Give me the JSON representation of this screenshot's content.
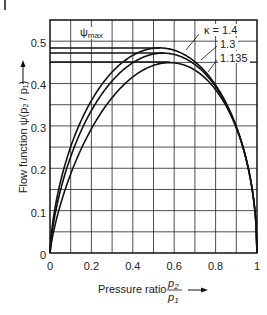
{
  "chart_data": {
    "type": "line",
    "title": "",
    "xlabel": "Pressure ratio p2/p1",
    "ylabel": "Flow function ψ(p2 / p1)",
    "xlim": [
      0,
      1
    ],
    "ylim": [
      0,
      0.55
    ],
    "grid": true,
    "x_ticks": [
      "0",
      "0.2",
      "0.4",
      "0.6",
      "0.8",
      "1"
    ],
    "y_ticks": [
      "0",
      "0.1",
      "0.2",
      "0.3",
      "0.4",
      "0.5"
    ],
    "annotations": [
      "ψmax",
      "κ = 1.4",
      "1.3",
      "1.135"
    ],
    "series": [
      {
        "name": "κ = 1.4",
        "kappa": 1.4,
        "psi_max": 0.484,
        "x_at_max": 0.528
      },
      {
        "name": "1.3",
        "kappa": 1.3,
        "psi_max": 0.472,
        "x_at_max": 0.546
      },
      {
        "name": "1.135",
        "kappa": 1.135,
        "psi_max": 0.451,
        "x_at_max": 0.577
      }
    ]
  },
  "labels": {
    "xlabel_text": "Pressure ratio",
    "xlabel_num": "p",
    "xlabel_num_sub": "2",
    "xlabel_den": "p",
    "xlabel_den_sub": "1",
    "ylabel": "Flow function ψ(p₂ / p₁)",
    "psimax": "ψ",
    "psimax_sub": "max",
    "k1": "κ = 1.4",
    "k2": "1.3",
    "k3": "1.135",
    "xt0": "0",
    "xt1": "0.2",
    "xt2": "0.4",
    "xt3": "0.6",
    "xt4": "0.8",
    "xt5": "1",
    "yt0": "0",
    "yt1": "0.1",
    "yt2": "0.2",
    "yt3": "0.3",
    "yt4": "0.4",
    "yt5": "0.5"
  }
}
